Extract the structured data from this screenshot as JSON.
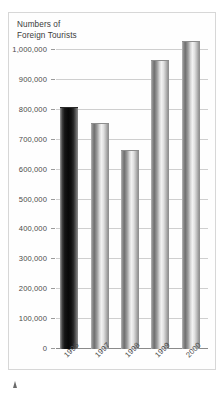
{
  "chart_data": {
    "type": "bar",
    "title": "Numbers of Foreign Tourists",
    "title_lines": [
      "Numbers of",
      "Foreign Tourists"
    ],
    "xlabel": "",
    "ylabel": "",
    "categories": [
      "1996",
      "1997",
      "1998",
      "1999",
      "2000"
    ],
    "values": [
      810000,
      755000,
      665000,
      965000,
      1030000
    ],
    "ylim": [
      0,
      1030000
    ],
    "yticks": [
      0,
      100000,
      200000,
      300000,
      400000,
      500000,
      600000,
      700000,
      800000,
      900000,
      1000000
    ],
    "ytick_labels": [
      "0",
      "100,000",
      "200,000",
      "300,000",
      "400,000",
      "500,000",
      "600,000",
      "700,000",
      "800,000",
      "900,000",
      "1,000,000"
    ],
    "grid": true,
    "legend": null,
    "highlight_index": 0,
    "colors": {
      "bar": "#bcbcbc",
      "bar_highlight": "#101010",
      "gridline": "#cfcfcf",
      "axis": "#8a8a8a",
      "text": "#4a4a4a",
      "frame": "#d7d7d7",
      "background": "#fefefe"
    }
  },
  "figure": {
    "footnote_marker": "caret-marker"
  }
}
